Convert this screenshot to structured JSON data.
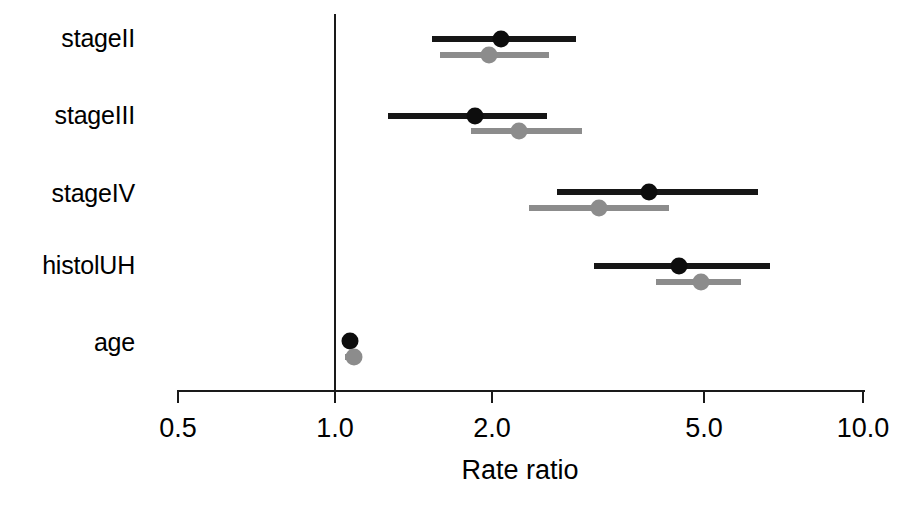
{
  "chart_data": {
    "type": "scatter",
    "subtype": "forest-plot",
    "title": "",
    "xlabel": "Rate ratio",
    "ylabel": "",
    "xscale": "log",
    "xlim": [
      0.5,
      10.0
    ],
    "xticks": [
      0.5,
      1.0,
      2.0,
      5.0,
      10.0
    ],
    "xticklabels": [
      "0.5",
      "1.0",
      "2.0",
      "5.0",
      "10.0"
    ],
    "grid": false,
    "legend": "none",
    "reference_line": 1.0,
    "categories": [
      "stageII",
      "stageIII",
      "stageIV",
      "histolUH",
      "age"
    ],
    "series": [
      {
        "name": "black",
        "color": "#161616",
        "estimates": [
          2.05,
          1.83,
          3.93,
          4.48,
          1.06
        ],
        "ci_lower": [
          1.52,
          1.25,
          2.62,
          3.08,
          1.03
        ],
        "ci_upper": [
          2.85,
          2.51,
          6.31,
          6.66,
          1.09
        ]
      },
      {
        "name": "grey",
        "color": "#8c8c8c",
        "estimates": [
          1.95,
          2.22,
          3.15,
          4.92,
          1.08
        ],
        "ci_lower": [
          1.57,
          1.8,
          2.32,
          4.05,
          1.04
        ],
        "ci_upper": [
          2.53,
          2.93,
          4.29,
          5.86,
          1.12
        ]
      }
    ]
  },
  "axis": {
    "title": "Rate ratio",
    "tick_labels": [
      "0.5",
      "1.0",
      "2.0",
      "5.0",
      "10.0"
    ]
  },
  "categories": {
    "labels": [
      "stageII",
      "stageIII",
      "stageIV",
      "histolUH",
      "age"
    ]
  }
}
